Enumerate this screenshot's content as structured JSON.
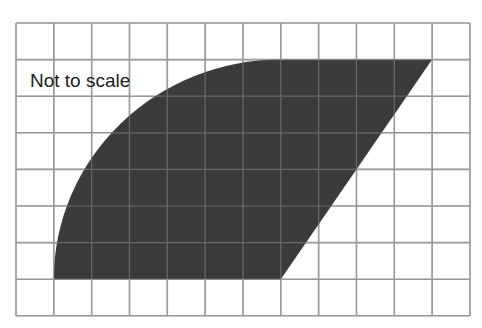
{
  "diagram": {
    "type": "shaded shape on square grid",
    "annotation": "Not to scale",
    "grid": {
      "columns": 12,
      "rows": 8,
      "origin_px": [
        16,
        23
      ],
      "cell_w_px": 37.83,
      "cell_h_px": 36.6,
      "line_color": "#8c8c8c"
    },
    "shape": {
      "description": "Quarter-circle arc from bottom-left rising to the top, straight top edge, slanted straight right edge down to the bottom",
      "fill_color": "#3b3b3b",
      "vertices_grid": {
        "bottom_left": [
          1,
          7
        ],
        "arc_center": [
          7,
          7
        ],
        "arc_top": [
          7,
          1
        ],
        "top_right": [
          11,
          1
        ],
        "bottom_right": [
          7,
          7
        ]
      },
      "arc_radius_cells": 6
    }
  }
}
